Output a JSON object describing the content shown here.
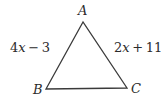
{
  "figure": {
    "type": "geometry-diagram",
    "shape": "triangle",
    "background_color": "#ffffff",
    "stroke_color": "#3a3a3a",
    "text_color": "#2b2b2b",
    "stroke_width": 1.3,
    "vertices": [
      {
        "name": "A",
        "label": "A",
        "x": 83,
        "y": 22
      },
      {
        "name": "B",
        "label": "B",
        "x": 46,
        "y": 89
      },
      {
        "name": "C",
        "label": "C",
        "x": 127,
        "y": 88
      }
    ],
    "sides": [
      {
        "name": "AB",
        "label": "4x − 3",
        "coefficient": "4",
        "variable": "x",
        "operator": "−",
        "constant": "3",
        "position": "left"
      },
      {
        "name": "AC",
        "label": "2x + 11",
        "coefficient": "2",
        "variable": "x",
        "operator": "+",
        "constant": "11",
        "position": "right"
      },
      {
        "name": "BC",
        "label": "",
        "position": "bottom"
      }
    ]
  }
}
